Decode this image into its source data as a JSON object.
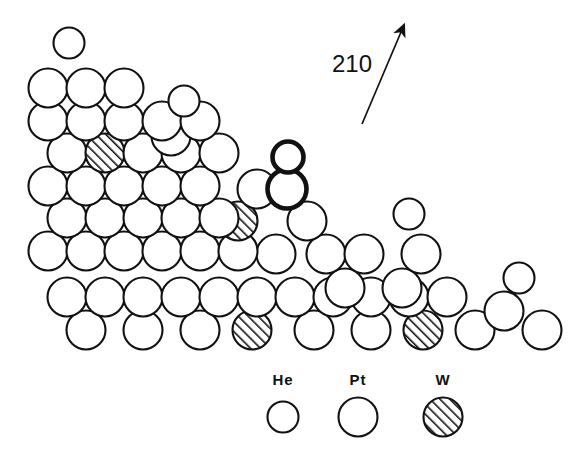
{
  "figure": {
    "kind": "hard-sphere-surface-model",
    "background_color": "#ffffff",
    "outline_color": "#111111",
    "hatch_color": "#111111",
    "width": 574,
    "height": 465
  },
  "direction_indicator": {
    "label": "210",
    "label_x": 352,
    "label_y": 64,
    "arrow_tail_x": 362,
    "arrow_tail_y": 124,
    "arrow_head_x": 404,
    "arrow_head_y": 25,
    "icon": "arrow-up-right-icon"
  },
  "legend": {
    "entries": [
      {
        "label": "He",
        "species": "helium",
        "style": "open",
        "radius": 15.5,
        "cx": 283,
        "cy": 417,
        "label_x": 283,
        "label_y": 371
      },
      {
        "label": "Pt",
        "species": "platinum",
        "style": "open",
        "radius": 19.5,
        "cx": 358,
        "cy": 417,
        "label_x": 358,
        "label_y": 371
      },
      {
        "label": "W",
        "species": "tungsten",
        "style": "hatched",
        "radius": 19.5,
        "cx": 443,
        "cy": 417,
        "label_x": 443,
        "label_y": 371
      }
    ]
  },
  "atoms": [
    {
      "id": "he-top-left",
      "species": "He",
      "style": "open",
      "cx": 69,
      "cy": 43,
      "r": 15.5,
      "bold": false
    },
    {
      "id": "he-upper-mid",
      "species": "He",
      "style": "open",
      "cx": 184,
      "cy": 101,
      "r": 15.5,
      "bold": false
    },
    {
      "id": "he-adatom-bold",
      "species": "He",
      "style": "open",
      "cx": 288,
      "cy": 157,
      "r": 15.5,
      "bold": true
    },
    {
      "id": "he-right-upper",
      "species": "He",
      "style": "open",
      "cx": 409,
      "cy": 214,
      "r": 15.5,
      "bold": false
    },
    {
      "id": "he-far-right",
      "species": "He",
      "style": "open",
      "cx": 519,
      "cy": 278,
      "r": 15.5,
      "bold": false
    },
    {
      "id": "pt-adatom-bold",
      "species": "Pt",
      "style": "open",
      "cx": 287,
      "cy": 189,
      "r": 19.5,
      "bold": true
    },
    {
      "id": "pt-r1-c1",
      "species": "Pt",
      "style": "open",
      "cx": 48,
      "cy": 88,
      "r": 19.5,
      "bold": false
    },
    {
      "id": "pt-r1-c2",
      "species": "Pt",
      "style": "open",
      "cx": 86,
      "cy": 88,
      "r": 19.5,
      "bold": false
    },
    {
      "id": "pt-r1-c3",
      "species": "Pt",
      "style": "open",
      "cx": 124,
      "cy": 88,
      "r": 19.5,
      "bold": false
    },
    {
      "id": "pt-r1-c4",
      "species": "Pt",
      "style": "open",
      "cx": 171,
      "cy": 136,
      "r": 19.5,
      "bold": false
    },
    {
      "id": "pt-r2-c1",
      "species": "Pt",
      "style": "open",
      "cx": 48,
      "cy": 121,
      "r": 19.5,
      "bold": false
    },
    {
      "id": "pt-r2-c2",
      "species": "Pt",
      "style": "open",
      "cx": 86,
      "cy": 121,
      "r": 19.5,
      "bold": false
    },
    {
      "id": "pt-r2-c3",
      "species": "Pt",
      "style": "open",
      "cx": 124,
      "cy": 121,
      "r": 19.5,
      "bold": false
    },
    {
      "id": "pt-r2-c4",
      "species": "Pt",
      "style": "open",
      "cx": 162,
      "cy": 121,
      "r": 19.5,
      "bold": false
    },
    {
      "id": "pt-r2-c5",
      "species": "Pt",
      "style": "open",
      "cx": 200,
      "cy": 121,
      "r": 19.5,
      "bold": false
    },
    {
      "id": "pt-r3-c1",
      "species": "Pt",
      "style": "open",
      "cx": 67,
      "cy": 153,
      "r": 19.5,
      "bold": false
    },
    {
      "id": "w-r3-c2",
      "species": "W",
      "style": "hatched",
      "cx": 105,
      "cy": 153,
      "r": 19.5,
      "bold": false
    },
    {
      "id": "pt-r3-c3",
      "species": "Pt",
      "style": "open",
      "cx": 143,
      "cy": 153,
      "r": 19.5,
      "bold": false
    },
    {
      "id": "pt-r3-c4",
      "species": "Pt",
      "style": "open",
      "cx": 181,
      "cy": 153,
      "r": 19.5,
      "bold": false
    },
    {
      "id": "pt-r3-c5",
      "species": "Pt",
      "style": "open",
      "cx": 219,
      "cy": 153,
      "r": 19.5,
      "bold": false
    },
    {
      "id": "pt-r3-c6",
      "species": "Pt",
      "style": "open",
      "cx": 257,
      "cy": 189,
      "r": 19.5,
      "bold": false
    },
    {
      "id": "pt-r4-c1",
      "species": "Pt",
      "style": "open",
      "cx": 48,
      "cy": 186,
      "r": 19.5,
      "bold": false
    },
    {
      "id": "pt-r4-c2",
      "species": "Pt",
      "style": "open",
      "cx": 86,
      "cy": 186,
      "r": 19.5,
      "bold": false
    },
    {
      "id": "pt-r4-c3",
      "species": "Pt",
      "style": "open",
      "cx": 124,
      "cy": 186,
      "r": 19.5,
      "bold": false
    },
    {
      "id": "pt-r4-c4",
      "species": "Pt",
      "style": "open",
      "cx": 162,
      "cy": 186,
      "r": 19.5,
      "bold": false
    },
    {
      "id": "pt-r4-c5",
      "species": "Pt",
      "style": "open",
      "cx": 200,
      "cy": 186,
      "r": 19.5,
      "bold": false
    },
    {
      "id": "w-r4-c6",
      "species": "W",
      "style": "hatched",
      "cx": 238,
      "cy": 221,
      "r": 19.5,
      "bold": false
    },
    {
      "id": "pt-r4-c7",
      "species": "Pt",
      "style": "open",
      "cx": 307,
      "cy": 221,
      "r": 19.5,
      "bold": false
    },
    {
      "id": "pt-r5-c1",
      "species": "Pt",
      "style": "open",
      "cx": 67,
      "cy": 218,
      "r": 19.5,
      "bold": false
    },
    {
      "id": "pt-r5-c2",
      "species": "Pt",
      "style": "open",
      "cx": 105,
      "cy": 218,
      "r": 19.5,
      "bold": false
    },
    {
      "id": "pt-r5-c3",
      "species": "Pt",
      "style": "open",
      "cx": 143,
      "cy": 218,
      "r": 19.5,
      "bold": false
    },
    {
      "id": "pt-r5-c4",
      "species": "Pt",
      "style": "open",
      "cx": 181,
      "cy": 218,
      "r": 19.5,
      "bold": false
    },
    {
      "id": "pt-r5-c5",
      "species": "Pt",
      "style": "open",
      "cx": 219,
      "cy": 218,
      "r": 19.5,
      "bold": false
    },
    {
      "id": "pt-r5-c6",
      "species": "Pt",
      "style": "open",
      "cx": 276,
      "cy": 254,
      "r": 19.5,
      "bold": false
    },
    {
      "id": "pt-r5-c7",
      "species": "Pt",
      "style": "open",
      "cx": 326,
      "cy": 254,
      "r": 19.5,
      "bold": false
    },
    {
      "id": "pt-r5-c8",
      "species": "Pt",
      "style": "open",
      "cx": 364,
      "cy": 254,
      "r": 19.5,
      "bold": false
    },
    {
      "id": "pt-r6-c1",
      "species": "Pt",
      "style": "open",
      "cx": 48,
      "cy": 251,
      "r": 19.5,
      "bold": false
    },
    {
      "id": "pt-r6-c2",
      "species": "Pt",
      "style": "open",
      "cx": 86,
      "cy": 251,
      "r": 19.5,
      "bold": false
    },
    {
      "id": "pt-r6-c3",
      "species": "Pt",
      "style": "open",
      "cx": 124,
      "cy": 251,
      "r": 19.5,
      "bold": false
    },
    {
      "id": "pt-r6-c4",
      "species": "Pt",
      "style": "open",
      "cx": 162,
      "cy": 251,
      "r": 19.5,
      "bold": false
    },
    {
      "id": "pt-r6-c5",
      "species": "Pt",
      "style": "open",
      "cx": 200,
      "cy": 251,
      "r": 19.5,
      "bold": false
    },
    {
      "id": "pt-r6-c6",
      "species": "Pt",
      "style": "open",
      "cx": 238,
      "cy": 251,
      "r": 19.5,
      "bold": false
    },
    {
      "id": "pt-r6-c7",
      "species": "Pt",
      "style": "open",
      "cx": 345,
      "cy": 288,
      "r": 19.5,
      "bold": false
    },
    {
      "id": "pt-r6-c8",
      "species": "Pt",
      "style": "open",
      "cx": 402,
      "cy": 288,
      "r": 19.5,
      "bold": false
    },
    {
      "id": "pt-r6-c9",
      "species": "Pt",
      "style": "open",
      "cx": 421,
      "cy": 254,
      "r": 19.5,
      "bold": false
    },
    {
      "id": "pt-r7-c1",
      "species": "Pt",
      "style": "open",
      "cx": 67,
      "cy": 297,
      "r": 19.5,
      "bold": false
    },
    {
      "id": "pt-r7-c2",
      "species": "Pt",
      "style": "open",
      "cx": 105,
      "cy": 297,
      "r": 19.5,
      "bold": false
    },
    {
      "id": "pt-r7-c3",
      "species": "Pt",
      "style": "open",
      "cx": 143,
      "cy": 297,
      "r": 19.5,
      "bold": false
    },
    {
      "id": "pt-r7-c4",
      "species": "Pt",
      "style": "open",
      "cx": 181,
      "cy": 297,
      "r": 19.5,
      "bold": false
    },
    {
      "id": "pt-r7-c5",
      "species": "Pt",
      "style": "open",
      "cx": 219,
      "cy": 297,
      "r": 19.5,
      "bold": false
    },
    {
      "id": "pt-r7-c6",
      "species": "Pt",
      "style": "open",
      "cx": 257,
      "cy": 297,
      "r": 19.5,
      "bold": false
    },
    {
      "id": "pt-r7-c7",
      "species": "Pt",
      "style": "open",
      "cx": 295,
      "cy": 297,
      "r": 19.5,
      "bold": false
    },
    {
      "id": "pt-r7-c8",
      "species": "Pt",
      "style": "open",
      "cx": 333,
      "cy": 297,
      "r": 19.5,
      "bold": false
    },
    {
      "id": "pt-r7-c9",
      "species": "Pt",
      "style": "open",
      "cx": 371,
      "cy": 297,
      "r": 19.5,
      "bold": false
    },
    {
      "id": "pt-r7-c10",
      "species": "Pt",
      "style": "open",
      "cx": 409,
      "cy": 297,
      "r": 19.5,
      "bold": false
    },
    {
      "id": "pt-r7-c11",
      "species": "Pt",
      "style": "open",
      "cx": 447,
      "cy": 297,
      "r": 19.5,
      "bold": false
    },
    {
      "id": "pt-r7-c12",
      "species": "Pt",
      "style": "open",
      "cx": 504,
      "cy": 311,
      "r": 19.5,
      "bold": false
    },
    {
      "id": "pt-r7-c13",
      "species": "Pt",
      "style": "open",
      "cx": 542,
      "cy": 330,
      "r": 19.5,
      "bold": false
    },
    {
      "id": "pt-r8-c1",
      "species": "Pt",
      "style": "open",
      "cx": 86,
      "cy": 330,
      "r": 19.5,
      "bold": false
    },
    {
      "id": "pt-r8-c2",
      "species": "Pt",
      "style": "open",
      "cx": 143,
      "cy": 330,
      "r": 19.5,
      "bold": false
    },
    {
      "id": "pt-r8-c3",
      "species": "Pt",
      "style": "open",
      "cx": 200,
      "cy": 330,
      "r": 19.5,
      "bold": false
    },
    {
      "id": "w-r8-c4",
      "species": "W",
      "style": "hatched",
      "cx": 252,
      "cy": 330,
      "r": 19.5,
      "bold": false
    },
    {
      "id": "pt-r8-c5",
      "species": "Pt",
      "style": "open",
      "cx": 314,
      "cy": 330,
      "r": 19.5,
      "bold": false
    },
    {
      "id": "pt-r8-c6",
      "species": "Pt",
      "style": "open",
      "cx": 371,
      "cy": 330,
      "r": 19.5,
      "bold": false
    },
    {
      "id": "w-r8-c7",
      "species": "W",
      "style": "hatched",
      "cx": 423,
      "cy": 330,
      "r": 19.5,
      "bold": false
    },
    {
      "id": "pt-r8-c8",
      "species": "Pt",
      "style": "open",
      "cx": 475,
      "cy": 330,
      "r": 19.5,
      "bold": false
    }
  ]
}
